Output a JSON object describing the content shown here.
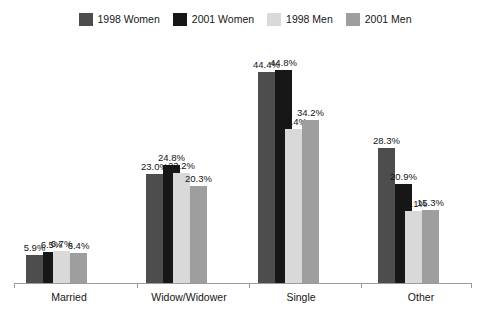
{
  "legend": {
    "entries": [
      {
        "label": "1998 Women",
        "color": "#4d4d4d",
        "swatch_name": "legend-swatch-1998-women"
      },
      {
        "label": "2001 Women",
        "color": "#171717",
        "swatch_name": "legend-swatch-2001-women"
      },
      {
        "label": "1998 Men",
        "color": "#d9d9d9",
        "swatch_name": "legend-swatch-1998-men"
      },
      {
        "label": "2001 Men",
        "color": "#9e9e9e",
        "swatch_name": "legend-swatch-2001-men"
      }
    ]
  },
  "axis": {
    "categories": [
      "Married",
      "Widow/Widower",
      "Single",
      "Other"
    ]
  },
  "chart_data": {
    "type": "bar",
    "title": "",
    "subtitle": "",
    "xlabel": "",
    "ylabel": "",
    "ylim": [
      0,
      48
    ],
    "grid": false,
    "legend_position": "top-center",
    "value_labels": true,
    "value_label_suffix": "%",
    "categories": [
      "Married",
      "Widow/Widower",
      "Single",
      "Other"
    ],
    "series": [
      {
        "name": "1998 Women",
        "color": "#4d4d4d",
        "values": [
          5.9,
          23.0,
          44.4,
          28.3
        ],
        "labels": [
          "5.9%",
          "23.0%",
          "44.4%",
          "28.3%"
        ]
      },
      {
        "name": "2001 Women",
        "color": "#171717",
        "values": [
          6.5,
          24.8,
          44.8,
          20.9
        ],
        "labels": [
          "6.5%",
          "24.8%",
          "44.8%",
          "20.9%"
        ]
      },
      {
        "name": "1998 Men",
        "color": "#d9d9d9",
        "values": [
          6.7,
          23.2,
          32.4,
          15.1
        ],
        "labels": [
          "6.7%",
          "23.2%",
          "32.4%",
          "15.1%"
        ]
      },
      {
        "name": "2001 Men",
        "color": "#9e9e9e",
        "values": [
          6.4,
          20.3,
          34.2,
          15.3
        ],
        "labels": [
          "6.4%",
          "20.3%",
          "34.2%",
          "15.3%"
        ]
      }
    ]
  }
}
